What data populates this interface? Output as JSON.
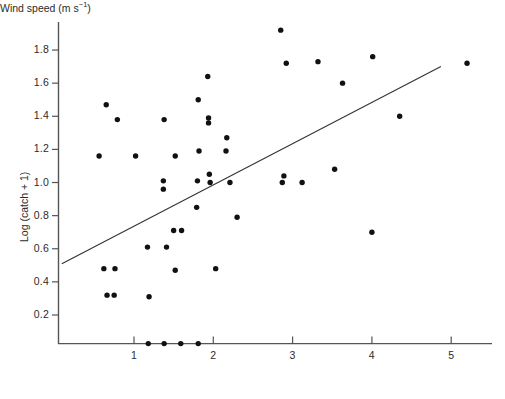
{
  "chart_data": {
    "type": "scatter",
    "title": "",
    "xlabel": "Wind speed (m s⁻¹)",
    "ylabel": "Log (catch + 1)",
    "xlabel_parts": {
      "main": "Wind speed (m s",
      "exponent": "−1",
      "tail": ")"
    },
    "xlim": [
      0.09,
      5.35
    ],
    "ylim": [
      0.0,
      1.92
    ],
    "xticks": [
      1,
      2,
      3,
      4,
      5
    ],
    "xtick_labels": [
      "1",
      "2",
      "3",
      "4",
      "5"
    ],
    "yticks": [
      0.2,
      0.4,
      0.6,
      0.8,
      1.0,
      1.2,
      1.4,
      1.6,
      1.8
    ],
    "ytick_labels": [
      "0.2",
      "0.4",
      "0.6",
      "0.8",
      "1.0",
      "1.2",
      "1.4",
      "1.6",
      "1.8"
    ],
    "grid": false,
    "legend": null,
    "marker": {
      "shape": "circle",
      "size": 4.2,
      "color": "#111111"
    },
    "axis_color": "#555555",
    "line_color": "#333333",
    "points": [
      {
        "x": 0.65,
        "y": 1.47
      },
      {
        "x": 0.79,
        "y": 1.38
      },
      {
        "x": 0.56,
        "y": 1.16
      },
      {
        "x": 0.62,
        "y": 0.48
      },
      {
        "x": 0.76,
        "y": 0.48
      },
      {
        "x": 0.66,
        "y": 0.32
      },
      {
        "x": 0.75,
        "y": 0.32
      },
      {
        "x": 1.02,
        "y": 1.16
      },
      {
        "x": 1.17,
        "y": 0.61
      },
      {
        "x": 1.19,
        "y": 0.31
      },
      {
        "x": 1.18,
        "y": 0.0
      },
      {
        "x": 1.38,
        "y": 0.0
      },
      {
        "x": 1.59,
        "y": 0.0
      },
      {
        "x": 1.81,
        "y": 0.0
      },
      {
        "x": 1.38,
        "y": 1.38
      },
      {
        "x": 1.37,
        "y": 1.01
      },
      {
        "x": 1.37,
        "y": 0.96
      },
      {
        "x": 1.41,
        "y": 0.61
      },
      {
        "x": 1.52,
        "y": 1.16
      },
      {
        "x": 1.5,
        "y": 0.71
      },
      {
        "x": 1.6,
        "y": 0.71
      },
      {
        "x": 1.52,
        "y": 0.47
      },
      {
        "x": 1.81,
        "y": 1.5
      },
      {
        "x": 1.82,
        "y": 1.19
      },
      {
        "x": 1.8,
        "y": 1.01
      },
      {
        "x": 1.79,
        "y": 0.85
      },
      {
        "x": 1.93,
        "y": 1.64
      },
      {
        "x": 1.94,
        "y": 1.39
      },
      {
        "x": 1.94,
        "y": 1.36
      },
      {
        "x": 1.95,
        "y": 1.05
      },
      {
        "x": 1.96,
        "y": 1.0
      },
      {
        "x": 2.03,
        "y": 0.48
      },
      {
        "x": 2.17,
        "y": 1.27
      },
      {
        "x": 2.16,
        "y": 1.19
      },
      {
        "x": 2.21,
        "y": 1.0
      },
      {
        "x": 2.3,
        "y": 0.79
      },
      {
        "x": 2.85,
        "y": 1.92
      },
      {
        "x": 2.92,
        "y": 1.72
      },
      {
        "x": 3.32,
        "y": 1.73
      },
      {
        "x": 2.89,
        "y": 1.04
      },
      {
        "x": 2.87,
        "y": 1.0
      },
      {
        "x": 3.12,
        "y": 1.0
      },
      {
        "x": 3.53,
        "y": 1.08
      },
      {
        "x": 3.63,
        "y": 1.6
      },
      {
        "x": 4.01,
        "y": 1.76
      },
      {
        "x": 4.0,
        "y": 0.7
      },
      {
        "x": 4.35,
        "y": 1.4
      },
      {
        "x": 5.2,
        "y": 1.72
      }
    ],
    "fit_line": {
      "x0": 0.09,
      "y0": 0.51,
      "x1": 4.87,
      "y1": 1.7
    }
  }
}
